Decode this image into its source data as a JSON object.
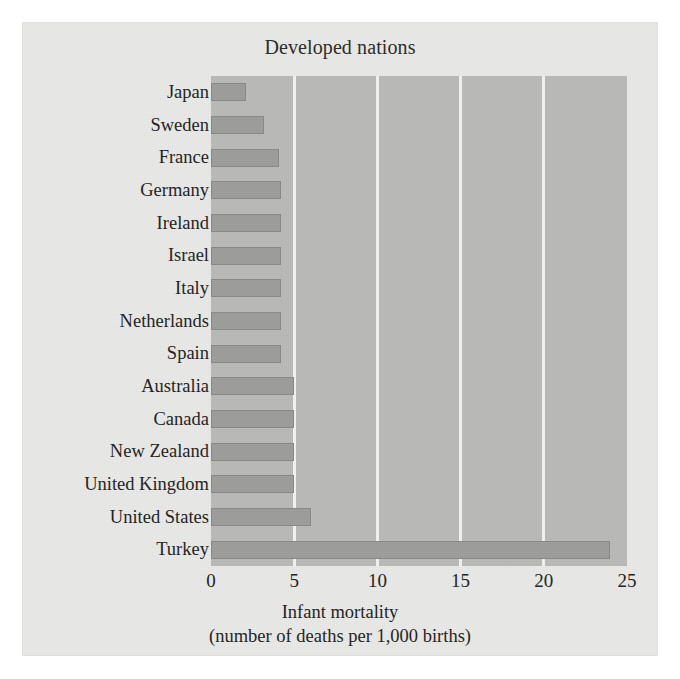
{
  "chart_data": {
    "type": "bar",
    "orientation": "horizontal",
    "title": "Developed nations",
    "xlabel": "Infant mortality",
    "xlabel_sub": "(number of deaths per 1,000 births)",
    "ylabel": "",
    "xlim": [
      0,
      25
    ],
    "xticks": [
      0,
      5,
      10,
      15,
      20,
      25
    ],
    "xtick_labels": [
      "0",
      "5",
      "10",
      "15",
      "20",
      "25"
    ],
    "grid": "vertical",
    "legend": "none",
    "categories": [
      "Japan",
      "Sweden",
      "France",
      "Germany",
      "Ireland",
      "Israel",
      "Italy",
      "Netherlands",
      "Spain",
      "Australia",
      "Canada",
      "New Zealand",
      "United Kingdom",
      "United States",
      "Turkey"
    ],
    "values": [
      2.1,
      3.2,
      4.1,
      4.2,
      4.2,
      4.2,
      4.2,
      4.2,
      4.2,
      5.0,
      5.0,
      5.0,
      5.0,
      6.0,
      24.0
    ],
    "colors": {
      "bar": "#9d9d9b",
      "plot_background": "#b9b9b7",
      "figure_background": "#e9e9e7",
      "gridline": "#f2f2f0",
      "text": "#222222"
    }
  }
}
